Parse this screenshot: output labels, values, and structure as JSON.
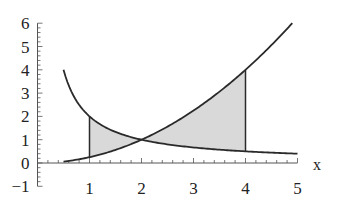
{
  "chart_data": {
    "type": "line",
    "title": "",
    "xlabel": "x",
    "ylabel": "",
    "xlim": [
      0,
      5
    ],
    "ylim": [
      -1,
      6
    ],
    "x_ticks": [
      1,
      2,
      3,
      4,
      5
    ],
    "x_tick_labels": [
      "1",
      "2",
      "3",
      "4",
      "5"
    ],
    "y_ticks": [
      -1,
      0,
      1,
      2,
      3,
      4,
      5,
      6
    ],
    "y_tick_labels": [
      "−1",
      "0",
      "1",
      "2",
      "3",
      "4",
      "5",
      "6"
    ],
    "grid": false,
    "legend": null,
    "series": [
      {
        "name": "y = 2/x",
        "x_range": [
          0.5,
          5
        ],
        "x": [
          0.5,
          0.75,
          1,
          1.5,
          2,
          2.5,
          3,
          3.5,
          4,
          4.5,
          5
        ],
        "values": [
          4,
          2.667,
          2,
          1.333,
          1,
          0.8,
          0.667,
          0.571,
          0.5,
          0.444,
          0.4
        ]
      },
      {
        "name": "y = x^2/4",
        "x_range": [
          0.5,
          4.9
        ],
        "x": [
          0.5,
          1,
          1.5,
          2,
          2.5,
          3,
          3.5,
          4,
          4.5,
          4.9
        ],
        "values": [
          0.0625,
          0.25,
          0.5625,
          1,
          1.5625,
          2.25,
          3.0625,
          4,
          5.0625,
          6.0
        ]
      }
    ],
    "shaded_regions": [
      {
        "between": [
          "y = 2/x",
          "y = x^2/4"
        ],
        "x_from": 1,
        "x_to": 2,
        "fill": "#d9d9d9"
      },
      {
        "between": [
          "y = x^2/4",
          "y = 2/x"
        ],
        "x_from": 2,
        "x_to": 4,
        "fill": "#d9d9d9"
      }
    ],
    "vertical_lines": [
      {
        "x": 1,
        "from": 0.25,
        "to": 2
      },
      {
        "x": 4,
        "from": 0.5,
        "to": 4
      }
    ],
    "colors": {
      "curve": "#2a2a2a",
      "axis": "#555555",
      "shade": "#d9d9d9"
    }
  }
}
